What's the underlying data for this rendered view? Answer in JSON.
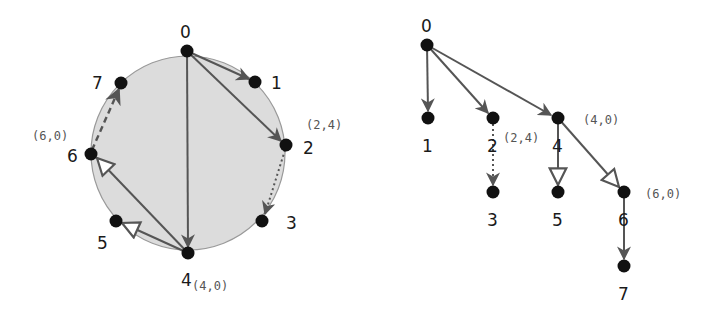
{
  "colors": {
    "node": "#111111",
    "edge": "#555555",
    "circle_fill": "#dcdcdc",
    "circle_stroke": "#999999"
  },
  "left_graph": {
    "title": "circular layout",
    "nodes": [
      {
        "id": "0",
        "label": "0"
      },
      {
        "id": "1",
        "label": "1"
      },
      {
        "id": "2",
        "label": "2",
        "coord": "(2,4)"
      },
      {
        "id": "3",
        "label": "3"
      },
      {
        "id": "4",
        "label": "4",
        "coord": "(4,0)"
      },
      {
        "id": "5",
        "label": "5"
      },
      {
        "id": "6",
        "label": "6",
        "coord": "(6,0)"
      },
      {
        "id": "7",
        "label": "7"
      }
    ],
    "edges": [
      {
        "from": "0",
        "to": "1",
        "style": "solid"
      },
      {
        "from": "0",
        "to": "2",
        "style": "solid"
      },
      {
        "from": "0",
        "to": "4",
        "style": "solid"
      },
      {
        "from": "2",
        "to": "3",
        "style": "dotted"
      },
      {
        "from": "4",
        "to": "5",
        "style": "hollow-arrow"
      },
      {
        "from": "4",
        "to": "6",
        "style": "hollow-arrow"
      },
      {
        "from": "6",
        "to": "7",
        "style": "dashed"
      }
    ]
  },
  "right_tree": {
    "nodes": [
      {
        "id": "0",
        "label": "0"
      },
      {
        "id": "1",
        "label": "1"
      },
      {
        "id": "2",
        "label": "2",
        "coord": "(2,4)"
      },
      {
        "id": "3",
        "label": "3"
      },
      {
        "id": "4",
        "label": "4",
        "coord": "(4,0)"
      },
      {
        "id": "5",
        "label": "5"
      },
      {
        "id": "6",
        "label": "6",
        "coord": "(6,0)"
      },
      {
        "id": "7",
        "label": "7"
      }
    ],
    "edges": [
      {
        "from": "0",
        "to": "1",
        "style": "solid"
      },
      {
        "from": "0",
        "to": "2",
        "style": "solid"
      },
      {
        "from": "0",
        "to": "4",
        "style": "solid"
      },
      {
        "from": "2",
        "to": "3",
        "style": "dotted"
      },
      {
        "from": "4",
        "to": "5",
        "style": "hollow-arrow"
      },
      {
        "from": "4",
        "to": "6",
        "style": "hollow-arrow"
      },
      {
        "from": "6",
        "to": "7",
        "style": "solid"
      }
    ]
  }
}
